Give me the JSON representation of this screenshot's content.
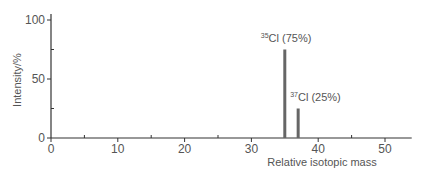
{
  "chart_data": {
    "type": "bar",
    "title": "",
    "xlabel": "Relative isotopic mass",
    "ylabel": "Intensity/%",
    "xlim": [
      0,
      54
    ],
    "ylim": [
      0,
      100
    ],
    "x_ticks": [
      0,
      10,
      20,
      30,
      40,
      50
    ],
    "y_ticks": [
      0,
      50,
      100
    ],
    "grid": false,
    "legend": null,
    "series": [
      {
        "name": "Chlorine isotopes",
        "x": [
          35,
          37
        ],
        "values": [
          75,
          25
        ]
      }
    ],
    "annotations": [
      {
        "isotope_mass": "35",
        "symbol": "Cl",
        "text": " (75%)",
        "x": 35,
        "y": 75
      },
      {
        "isotope_mass": "37",
        "symbol": "Cl",
        "text": " (25%)",
        "x": 37,
        "y": 25
      }
    ],
    "colors": {
      "bars": "#666666",
      "axes": "#333333",
      "text": "#555555"
    }
  }
}
